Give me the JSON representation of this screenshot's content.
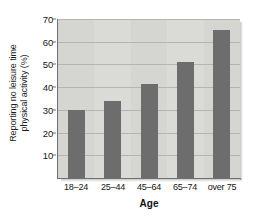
{
  "chart_data": {
    "type": "bar",
    "title": "",
    "xlabel": "Age",
    "ylabel": "Reporting no leisure time physical activity (%)",
    "ylabel_lines": [
      "Reporting no leisure time",
      "physical activity (%)"
    ],
    "categories": [
      "18–24",
      "25–44",
      "45–64",
      "65–74",
      "over 75"
    ],
    "values": [
      30,
      34,
      41.5,
      51,
      65
    ],
    "ylim": [
      0,
      70
    ],
    "yticks": [
      10,
      20,
      30,
      40,
      50,
      60,
      70
    ],
    "ytick_labels": [
      "10",
      "20",
      "30",
      "40",
      "50",
      "60",
      "70"
    ],
    "grid": true,
    "grid_axis": "y",
    "legend": false,
    "legend_position": "none",
    "bar_color": "#6d6d6d",
    "plot_background": "#d5d5d1",
    "gridline_color": "#b4b4b0",
    "axis_color": "#6f6f6f",
    "text_color": "#141414",
    "figure_background": "#ffffff"
  }
}
